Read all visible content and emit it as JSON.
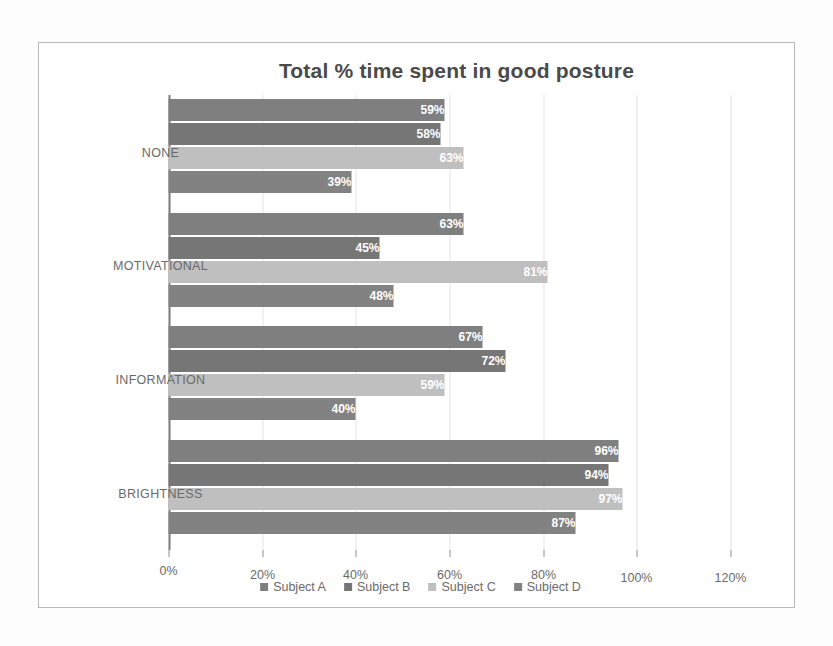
{
  "chart_data": {
    "type": "bar",
    "title": "Total % time spent in good posture",
    "xlabel": "",
    "ylabel": "Total % time spent in good posture",
    "categories": [
      "NONE",
      "MOTIVATIONAL",
      "INFORMATION",
      "BRIGHTNESS"
    ],
    "ylim": [
      0,
      120
    ],
    "ytick_labels": [
      "0%",
      "20%",
      "40%",
      "60%",
      "80%",
      "100%",
      "120%"
    ],
    "ytick_values": [
      0,
      20,
      40,
      60,
      80,
      100,
      120
    ],
    "grid": true,
    "legend_position": "bottom",
    "orientation": "rotated-90",
    "series": [
      {
        "name": "Subject A",
        "color": "#7f7f7f",
        "values": [
          59,
          63,
          67,
          96
        ],
        "labels": [
          "59%",
          "63%",
          "67%",
          "96%"
        ]
      },
      {
        "name": "Subject B",
        "color": "#767676",
        "values": [
          58,
          45,
          72,
          94
        ],
        "labels": [
          "58%",
          "45%",
          "72%",
          "94%"
        ]
      },
      {
        "name": "Subject C",
        "color": "#bfbfbf",
        "values": [
          63,
          81,
          59,
          97
        ],
        "labels": [
          "63%",
          "81%",
          "59%",
          "97%"
        ]
      },
      {
        "name": "Subject D",
        "color": "#828282",
        "values": [
          39,
          48,
          40,
          87
        ],
        "labels": [
          "39%",
          "48%",
          "40%",
          "87%"
        ]
      }
    ]
  },
  "legend": {
    "items": [
      {
        "label": "Subject A",
        "color": "#7f7f7f"
      },
      {
        "label": "Subject B",
        "color": "#767676"
      },
      {
        "label": "Subject C",
        "color": "#bfbfbf"
      },
      {
        "label": "Subject D",
        "color": "#828282"
      }
    ]
  },
  "axis": {
    "tick_labels": [
      "0%",
      "20%",
      "40%",
      "60%",
      "80%",
      "100%",
      "120%"
    ]
  },
  "colors": {
    "gridline": "#e3e3e3",
    "baseline": "#7a7a7a",
    "frame": "#b9b9b9",
    "text": "#6a6a6a",
    "title": "#4a4a4a",
    "bar_label": "#ffffff"
  }
}
